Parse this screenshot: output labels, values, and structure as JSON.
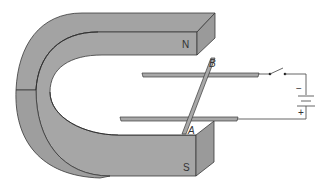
{
  "diagram": {
    "magnet": {
      "north_label": "N",
      "south_label": "S",
      "fill_color": "#a6a6a6",
      "side_color": "#9a9a9a",
      "edge_color": "#3a3a3a"
    },
    "rod": {
      "top_end_label": "B",
      "bottom_end_label": "A",
      "fill_color": "#a8a8a8"
    },
    "battery": {
      "negative_label": "−",
      "positive_label": "+"
    },
    "switch": {
      "state": "open"
    },
    "wire_color": "#555555"
  }
}
